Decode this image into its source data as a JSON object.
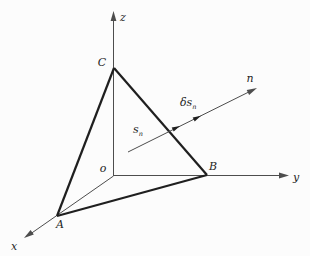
{
  "figure": {
    "background": "#fcfcfc",
    "ink": "#1f1f1f",
    "axis_color": "#4d4d4d",
    "axes": {
      "x": "x",
      "y": "y",
      "z": "z",
      "n": "n"
    },
    "points": {
      "origin": "o",
      "A": "A",
      "B": "B",
      "C": "C"
    },
    "annotations": {
      "s_base": "s",
      "s_sub": "n",
      "ds_base": "δs",
      "ds_sub": "n"
    }
  }
}
